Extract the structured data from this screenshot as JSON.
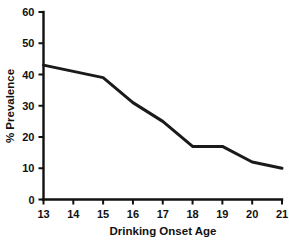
{
  "chart_data": {
    "type": "line",
    "title": "",
    "xlabel": "Drinking Onset Age",
    "ylabel": "% Prevalence",
    "x": [
      13,
      14,
      15,
      16,
      17,
      18,
      19,
      20,
      21
    ],
    "values": [
      43,
      41,
      39,
      31,
      25,
      17,
      17,
      12,
      10
    ],
    "series": [
      {
        "name": "Prevalence",
        "values": [
          43,
          41,
          39,
          31,
          25,
          17,
          17,
          12,
          10
        ],
        "color": "#1a1a1a"
      }
    ],
    "xlim": [
      13,
      21
    ],
    "ylim": [
      0,
      60
    ],
    "xticks": [
      13,
      14,
      15,
      16,
      17,
      18,
      19,
      20,
      21
    ],
    "yticks": [
      0,
      10,
      20,
      30,
      40,
      50,
      60
    ],
    "xtick_labels": [
      "13",
      "14",
      "15",
      "16",
      "17",
      "18",
      "19",
      "20",
      "21"
    ],
    "ytick_labels": [
      "0",
      "10",
      "20",
      "30",
      "40",
      "50",
      "60"
    ],
    "grid": false,
    "legend": false,
    "legend_position": "none",
    "background_color": "#ffffff",
    "axis_color": "#111111"
  }
}
